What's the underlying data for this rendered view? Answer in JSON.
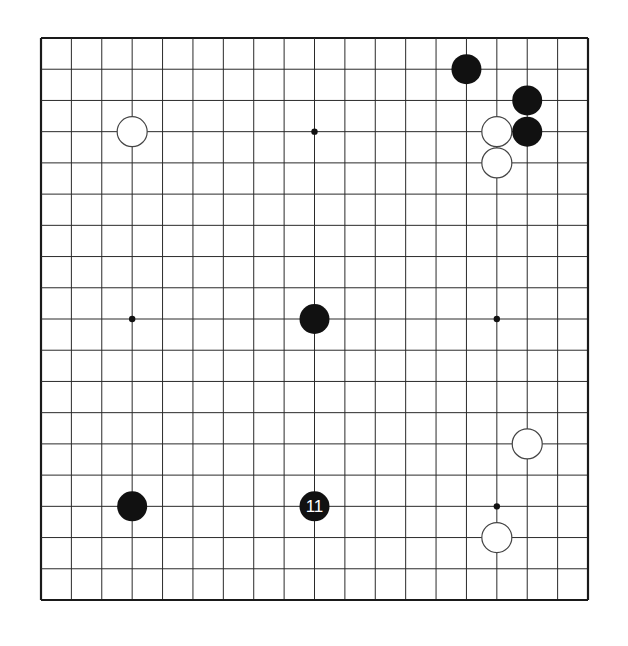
{
  "board": {
    "size": 19,
    "left": 41,
    "top": 38,
    "right": 588,
    "bottom": 600,
    "line_color": "#2a2a2a",
    "border_color": "#1a1a1a",
    "background": "#ffffff",
    "hoshi": [
      [
        3,
        3
      ],
      [
        9,
        3
      ],
      [
        15,
        3
      ],
      [
        3,
        9
      ],
      [
        9,
        9
      ],
      [
        15,
        9
      ],
      [
        3,
        15
      ],
      [
        9,
        15
      ],
      [
        15,
        15
      ]
    ]
  },
  "stones": [
    {
      "color": "white",
      "col": 3,
      "row": 3,
      "label": ""
    },
    {
      "color": "black",
      "col": 14,
      "row": 1,
      "label": ""
    },
    {
      "color": "black",
      "col": 16,
      "row": 2,
      "label": ""
    },
    {
      "color": "white",
      "col": 15,
      "row": 3,
      "label": ""
    },
    {
      "color": "black",
      "col": 16,
      "row": 3,
      "label": ""
    },
    {
      "color": "white",
      "col": 15,
      "row": 4,
      "label": ""
    },
    {
      "color": "black",
      "col": 9,
      "row": 9,
      "label": ""
    },
    {
      "color": "white",
      "col": 16,
      "row": 13,
      "label": ""
    },
    {
      "color": "black",
      "col": 3,
      "row": 15,
      "label": ""
    },
    {
      "color": "black",
      "col": 9,
      "row": 15,
      "label": "11"
    },
    {
      "color": "white",
      "col": 15,
      "row": 16,
      "label": ""
    }
  ],
  "colors": {
    "black_stone": "#111111",
    "white_stone": "#ffffff",
    "white_stroke": "#444444",
    "label_on_black": "#ffffff"
  }
}
